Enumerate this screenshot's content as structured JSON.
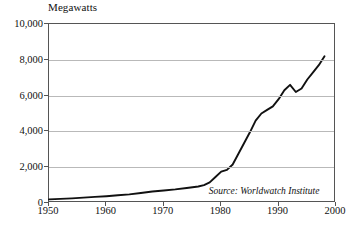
{
  "chart_data": {
    "type": "line",
    "title": "",
    "ylabel": "Megawatts",
    "xlabel": "",
    "xlim": [
      1950,
      2000
    ],
    "ylim": [
      0,
      10000
    ],
    "grid": true,
    "legend": false,
    "annotation": "Source: Worldwatch Institute",
    "ytick_labels": [
      "10,000",
      "8,000",
      "6,000",
      "4,000",
      "2,000",
      "0"
    ],
    "ytick_values": [
      10000,
      8000,
      6000,
      4000,
      2000,
      0
    ],
    "xtick_labels": [
      "1950",
      "1960",
      "1970",
      "1980",
      "1990",
      "2000"
    ],
    "xtick_values": [
      1950,
      1960,
      1970,
      1980,
      1990,
      2000
    ],
    "series": [
      {
        "name": "Installed capacity",
        "color": "#111111",
        "x": [
          1950,
          1952,
          1954,
          1956,
          1958,
          1960,
          1962,
          1964,
          1966,
          1968,
          1970,
          1972,
          1974,
          1976,
          1977,
          1978,
          1979,
          1980,
          1981,
          1982,
          1983,
          1984,
          1985,
          1986,
          1987,
          1988,
          1989,
          1990,
          1991,
          1992,
          1993,
          1994,
          1995,
          1996,
          1997,
          1998
        ],
        "y": [
          200,
          230,
          260,
          300,
          340,
          380,
          430,
          480,
          560,
          640,
          700,
          760,
          840,
          920,
          1000,
          1150,
          1450,
          1750,
          1850,
          2150,
          2750,
          3350,
          3950,
          4600,
          5000,
          5200,
          5400,
          5800,
          6300,
          6600,
          6200,
          6400,
          6900,
          7300,
          7700,
          8200
        ]
      }
    ]
  },
  "annotations": {
    "source": "Source: Worldwatch Institute"
  },
  "axis": {
    "unit_caption": "Megawatts"
  }
}
